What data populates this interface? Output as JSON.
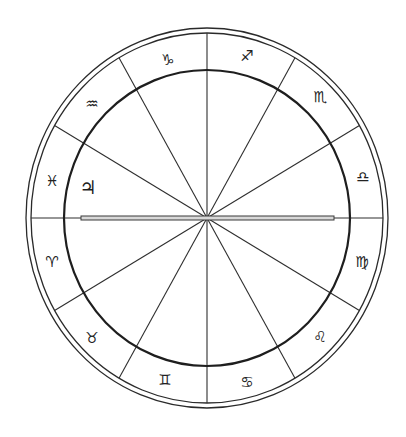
{
  "chart_data": {
    "type": "astrological-wheel",
    "title": "",
    "center": {
      "x": 207,
      "y": 218
    },
    "outer_rim": {
      "rx_outer": 181,
      "ry_outer": 190,
      "rx_inner": 176,
      "ry_inner": 185
    },
    "inner_circle": {
      "rx": 143,
      "ry": 148
    },
    "house_divisions": 12,
    "division_angle_deg": 30,
    "horizon_axis": {
      "x_start": 81,
      "x_end": 334,
      "style": "double-line"
    },
    "zodiac_band": [
      {
        "sign": "Aries",
        "glyph": "♈",
        "x": 52,
        "y": 262
      },
      {
        "sign": "Taurus",
        "glyph": "♉",
        "x": 92,
        "y": 338
      },
      {
        "sign": "Gemini",
        "glyph": "♊",
        "x": 165,
        "y": 380
      },
      {
        "sign": "Cancer",
        "glyph": "♋",
        "x": 247,
        "y": 382
      },
      {
        "sign": "Leo",
        "glyph": "♌",
        "x": 320,
        "y": 337
      },
      {
        "sign": "Virgo",
        "glyph": "♍",
        "x": 362,
        "y": 262
      },
      {
        "sign": "Libra",
        "glyph": "♎",
        "x": 363,
        "y": 177
      },
      {
        "sign": "Scorpio",
        "glyph": "♏",
        "x": 320,
        "y": 97
      },
      {
        "sign": "Sagittarius",
        "glyph": "♐",
        "x": 247,
        "y": 56
      },
      {
        "sign": "Capricorn",
        "glyph": "♑",
        "x": 168,
        "y": 60
      },
      {
        "sign": "Aquarius",
        "glyph": "♒",
        "x": 92,
        "y": 104
      },
      {
        "sign": "Pisces",
        "glyph": "♓",
        "x": 52,
        "y": 181
      }
    ],
    "planets": [
      {
        "name": "Jupiter",
        "glyph": "♃",
        "x": 88,
        "y": 187
      }
    ]
  },
  "colors": {
    "background": "#ffffff",
    "ink": "#222222",
    "axis_fill": "#d8d8d8"
  }
}
